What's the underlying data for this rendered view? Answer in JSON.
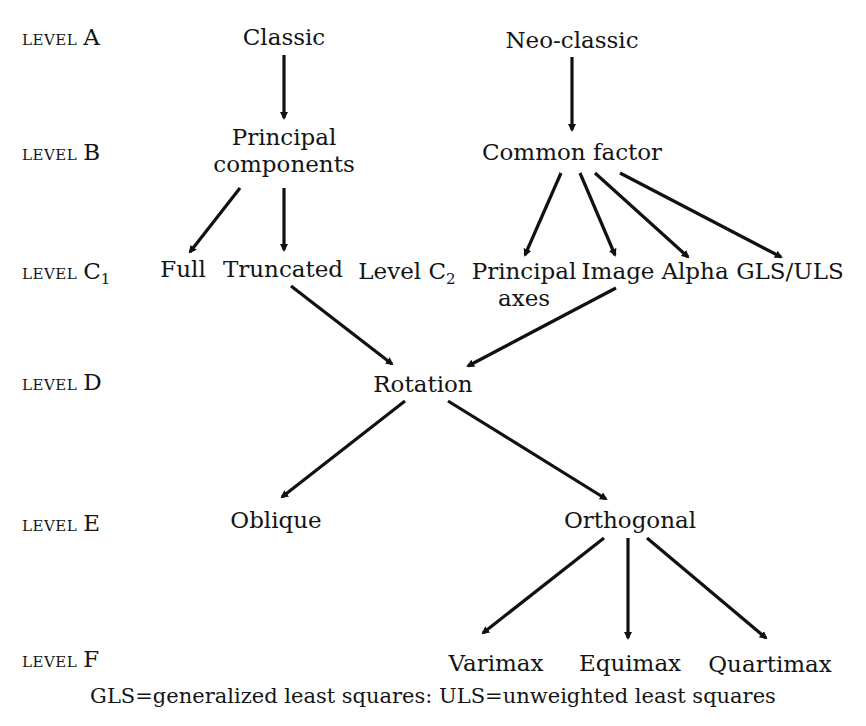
{
  "levels": {
    "A": {
      "prefix": "LEVEL",
      "letter": "A"
    },
    "B": {
      "prefix": "LEVEL",
      "letter": "B"
    },
    "C1": {
      "prefix": "LEVEL",
      "letter": "C",
      "sub": "1"
    },
    "D": {
      "prefix": "LEVEL",
      "letter": "D"
    },
    "E": {
      "prefix": "LEVEL",
      "letter": "E"
    },
    "F": {
      "prefix": "LEVEL",
      "letter": "F"
    }
  },
  "nodes": {
    "classic": "Classic",
    "neo_classic": "Neo-classic",
    "principal_components_line1": "Principal",
    "principal_components_line2": "components",
    "common_factor": "Common factor",
    "full": "Full",
    "truncated": "Truncated",
    "level_c2_label": "Level C",
    "level_c2_sub": "2",
    "principal_axes_line1": "Principal",
    "principal_axes_line2": "axes",
    "image": "Image",
    "alpha": "Alpha",
    "gls_uls": "GLS/ULS",
    "rotation": "Rotation",
    "oblique": "Oblique",
    "orthogonal": "Orthogonal",
    "varimax": "Varimax",
    "equimax": "Equimax",
    "quartimax": "Quartimax"
  },
  "edges": [
    [
      "Classic",
      "Principal components"
    ],
    [
      "Neo-classic",
      "Common factor"
    ],
    [
      "Principal components",
      "Full"
    ],
    [
      "Principal components",
      "Truncated"
    ],
    [
      "Common factor",
      "Principal axes"
    ],
    [
      "Common factor",
      "Image"
    ],
    [
      "Common factor",
      "Alpha"
    ],
    [
      "Common factor",
      "GLS/ULS"
    ],
    [
      "Truncated",
      "Rotation"
    ],
    [
      "Image",
      "Rotation"
    ],
    [
      "Rotation",
      "Oblique"
    ],
    [
      "Rotation",
      "Orthogonal"
    ],
    [
      "Orthogonal",
      "Varimax"
    ],
    [
      "Orthogonal",
      "Equimax"
    ],
    [
      "Orthogonal",
      "Quartimax"
    ]
  ],
  "footnote": "GLS=generalized least squares:  ULS=unweighted least squares"
}
